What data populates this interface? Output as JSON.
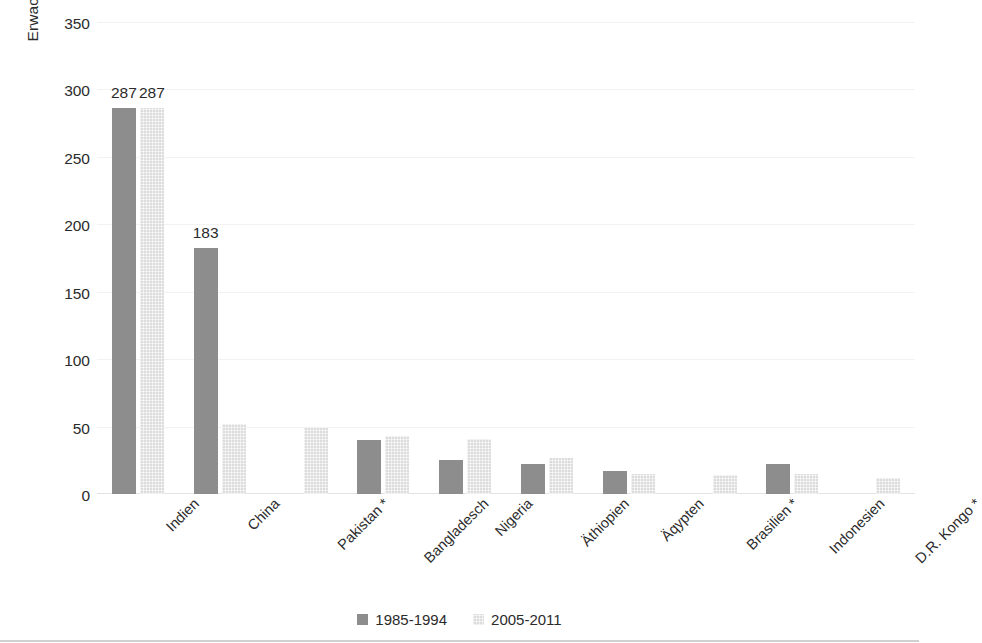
{
  "chart_data": {
    "type": "bar",
    "title": "",
    "subtitle": "",
    "xlabel": "",
    "ylabel": "Erwachsene Analphabeten (in Millionen",
    "ylim": [
      0,
      350
    ],
    "yticks": [
      0,
      50,
      100,
      150,
      200,
      250,
      300,
      350
    ],
    "ytick_labels": [
      "0",
      "50",
      "100",
      "150",
      "200",
      "250",
      "300",
      "350"
    ],
    "grid": true,
    "grid_axis": "y",
    "legend_position": "bottom",
    "categories": [
      "Indien",
      "China",
      "Pakistan *",
      "Bangladesch",
      "Nigeria",
      "Äthiopien",
      "Äqypten",
      "Brasilien *",
      "Indonesien",
      "D.R. Kongo *"
    ],
    "series": [
      {
        "name": "1985-1994",
        "color": "#8d8d8d",
        "values": [
          287,
          183,
          null,
          40,
          25,
          22,
          17,
          null,
          22,
          null
        ]
      },
      {
        "name": "2005-2011",
        "color": "#dcdcdc",
        "values": [
          287,
          52,
          49,
          43,
          41,
          27,
          15,
          14,
          15,
          12
        ]
      }
    ],
    "data_labels": [
      {
        "category": "Indien",
        "series": "1985-1994",
        "text": "287"
      },
      {
        "category": "Indien",
        "series": "2005-2011",
        "text": "287"
      },
      {
        "category": "China",
        "series": "1985-1994",
        "text": "183"
      }
    ],
    "footnote_marker": "*"
  },
  "legend": {
    "items": [
      {
        "label": "1985-1994",
        "swatch": "dark-gray-swatch"
      },
      {
        "label": "2005-2011",
        "swatch": "light-gray-swatch"
      }
    ]
  },
  "colors": {
    "series_1": "#8d8d8d",
    "series_2": "#dcdcdc",
    "gridline": "#f2f2f2",
    "axis": "#e3e3e3",
    "text": "#2b2b2b",
    "background": "#ffffff"
  }
}
